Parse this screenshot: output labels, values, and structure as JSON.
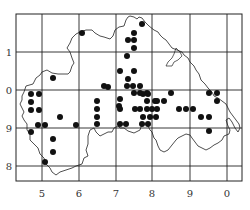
{
  "map": {
    "type": "dot-distribution-map",
    "frame": {
      "x": 16,
      "y": 14,
      "width": 226,
      "height": 167
    },
    "x_ticks": [
      {
        "label": "5",
        "x": 42
      },
      {
        "label": "6",
        "x": 79
      },
      {
        "label": "7",
        "x": 116
      },
      {
        "label": "8",
        "x": 152
      },
      {
        "label": "9",
        "x": 190
      },
      {
        "label": "0",
        "x": 227
      }
    ],
    "y_ticks": [
      {
        "label": "1",
        "y": 52
      },
      {
        "label": "0",
        "y": 90
      },
      {
        "label": "9",
        "y": 128
      },
      {
        "label": "8",
        "y": 166
      }
    ],
    "colors": {
      "line": "#222222",
      "dot": "#111111",
      "background": "#ffffff"
    },
    "dots": [
      [
        82,
        33
      ],
      [
        142,
        24
      ],
      [
        134,
        33
      ],
      [
        128,
        40
      ],
      [
        134,
        40
      ],
      [
        134,
        48
      ],
      [
        127,
        56
      ],
      [
        53,
        78
      ],
      [
        120,
        71
      ],
      [
        134,
        71
      ],
      [
        128,
        79
      ],
      [
        31,
        94
      ],
      [
        39,
        94
      ],
      [
        31,
        102
      ],
      [
        31,
        110
      ],
      [
        39,
        110
      ],
      [
        104,
        86
      ],
      [
        127,
        86
      ],
      [
        133,
        86
      ],
      [
        140,
        86
      ],
      [
        108,
        87
      ],
      [
        134,
        93
      ],
      [
        140,
        93
      ],
      [
        147,
        93
      ],
      [
        143,
        94
      ],
      [
        148,
        94
      ],
      [
        171,
        93
      ],
      [
        209,
        93
      ],
      [
        217,
        93
      ],
      [
        120,
        99
      ],
      [
        97,
        101
      ],
      [
        147,
        101
      ],
      [
        155,
        101
      ],
      [
        157,
        101
      ],
      [
        164,
        101
      ],
      [
        217,
        101
      ],
      [
        97,
        109
      ],
      [
        119,
        106
      ],
      [
        60,
        117
      ],
      [
        97,
        117
      ],
      [
        120,
        109
      ],
      [
        135,
        109
      ],
      [
        140,
        109
      ],
      [
        147,
        109
      ],
      [
        152,
        109
      ],
      [
        157,
        109
      ],
      [
        179,
        109
      ],
      [
        186,
        109
      ],
      [
        193,
        109
      ],
      [
        143,
        117
      ],
      [
        150,
        117
      ],
      [
        156,
        117
      ],
      [
        201,
        117
      ],
      [
        209,
        117
      ],
      [
        38,
        125
      ],
      [
        45,
        125
      ],
      [
        76,
        125
      ],
      [
        97,
        124
      ],
      [
        120,
        124
      ],
      [
        126,
        124
      ],
      [
        142,
        124
      ],
      [
        148,
        124
      ],
      [
        31,
        132
      ],
      [
        209,
        131
      ],
      [
        53,
        139
      ],
      [
        53,
        152
      ],
      [
        45,
        162
      ]
    ]
  }
}
